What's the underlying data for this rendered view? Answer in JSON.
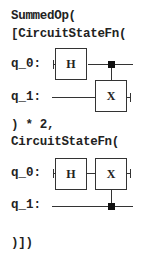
{
  "code": {
    "line1": "SummedOp(",
    "line2": "[CircuitStateFn(",
    "line3": ") * 2,",
    "line4": "CircuitStateFn(",
    "line5": ")])"
  },
  "circuit1": {
    "qubits": [
      "q_0:",
      "q_1:"
    ],
    "gates": [
      {
        "label": "H",
        "qubit": "q_0"
      },
      {
        "label": "X",
        "qubit": "q_1",
        "control": "q_0"
      }
    ]
  },
  "circuit2": {
    "qubits": [
      "q_0:",
      "q_1:"
    ],
    "gates": [
      {
        "label": "H",
        "qubit": "q_0"
      },
      {
        "label": "X",
        "qubit": "q_0",
        "control": "q_1"
      }
    ]
  }
}
